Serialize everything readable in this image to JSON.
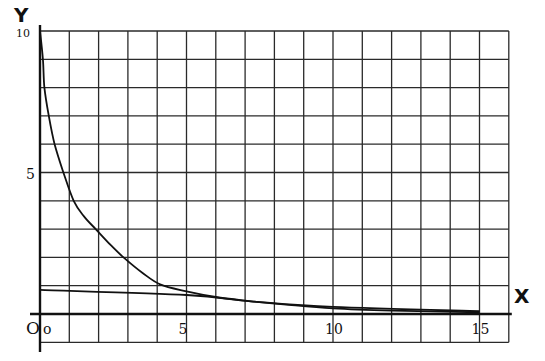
{
  "chart_data": {
    "type": "line",
    "title": "",
    "xlabel": "X",
    "ylabel": "Y",
    "origin_label": "O",
    "xlim": [
      0,
      16
    ],
    "ylim": [
      -1,
      10
    ],
    "grid": true,
    "grid_step": 1,
    "x_ticks": [
      0,
      5,
      10,
      15
    ],
    "x_tick_labels": [
      "o",
      "5",
      "10",
      "15"
    ],
    "y_ticks": [
      5,
      10
    ],
    "y_tick_labels": [
      "5",
      "10"
    ],
    "legend": null,
    "series": [
      {
        "name": "steep decreasing curve",
        "x": [
          0,
          0.1,
          0.15,
          0.3,
          0.5,
          0.8,
          1.15,
          1.5,
          1.9,
          2.4,
          2.85,
          3.5,
          4.1,
          5,
          6,
          7.2,
          8.5,
          10,
          12,
          15
        ],
        "y": [
          10,
          9,
          8,
          7,
          6,
          5,
          4,
          3.45,
          3,
          2.45,
          2,
          1.45,
          1.05,
          0.8,
          0.6,
          0.45,
          0.32,
          0.2,
          0.12,
          0.06
        ]
      },
      {
        "name": "shallow straight line",
        "x": [
          0,
          5,
          7.2,
          10,
          15
        ],
        "y": [
          0.85,
          0.67,
          0.45,
          0.25,
          0.1
        ]
      }
    ]
  }
}
